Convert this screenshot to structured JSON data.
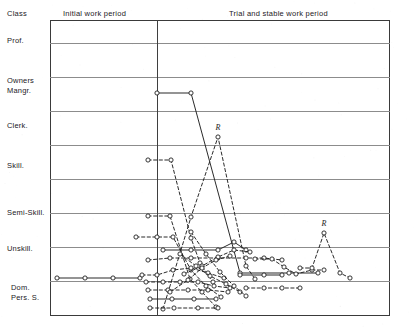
{
  "header": {
    "class_label": "Class",
    "period_initial": "Initial work period",
    "period_trial": "Trial and stable work period"
  },
  "chart_data": {
    "type": "line",
    "title": "",
    "subtitle": "",
    "xlabel": "",
    "ylabel": "Class",
    "grid": true,
    "legend_position": "none",
    "note": "Career mobility trajectories; each polyline is one subject tracked across successive jobs. Circle markers are job positions. Solid and dashed strokes distinguish individual subjects. 'R' annotates peak positions.",
    "categories": [
      "Prof.",
      "Owners Mangr.",
      "Clerk.",
      "Skill.",
      "Semi-Skill.",
      "Unskill.",
      "Dom. Pers. S."
    ],
    "y_axis_labels": [
      {
        "line1": "Prof.",
        "line2": ""
      },
      {
        "line1": "Owners",
        "line2": "Mangr."
      },
      {
        "line1": "Clerk.",
        "line2": ""
      },
      {
        "line1": "Skill.",
        "line2": ""
      },
      {
        "line1": "Semi-Skill.",
        "line2": ""
      },
      {
        "line1": "Unskill.",
        "line2": ""
      },
      {
        "line1": "Dom.",
        "line2": "Pers. S."
      }
    ],
    "y_label_positions": [
      41,
      81,
      126,
      166,
      213,
      249,
      288
    ],
    "gridline_positions": [
      23,
      57,
      91,
      125,
      159,
      193,
      227,
      261
    ],
    "divider_x": 107,
    "xlim": [
      0,
      340
    ],
    "ylim": [
      0,
      296
    ],
    "annotations": [
      {
        "text": "R",
        "x": 168,
        "y": 110,
        "series": "s-clerk-peak"
      },
      {
        "text": "R",
        "x": 274,
        "y": 206,
        "series": "s-right-peak"
      }
    ],
    "series": [
      {
        "name": "owners-descent",
        "style": "solid",
        "points": [
          [
            107,
            73
          ],
          [
            141,
            73
          ],
          [
            190,
            253
          ],
          [
            239,
            253
          ],
          [
            268,
            253
          ]
        ]
      },
      {
        "name": "clerk-peak",
        "style": "dashed",
        "points": [
          [
            113,
            289
          ],
          [
            141,
            197
          ],
          [
            168,
            117
          ],
          [
            196,
            246
          ],
          [
            205,
            259
          ]
        ]
      },
      {
        "name": "skill-start",
        "style": "dashed",
        "points": [
          [
            98,
            140
          ],
          [
            121,
            140
          ],
          [
            141,
            218
          ],
          [
            150,
            243
          ],
          [
            163,
            262
          ]
        ]
      },
      {
        "name": "semiskill-start",
        "style": "dashed",
        "points": [
          [
            98,
            196
          ],
          [
            120,
            196
          ],
          [
            140,
            259
          ],
          [
            152,
            272
          ],
          [
            166,
            287
          ]
        ]
      },
      {
        "name": "unskill-a",
        "style": "dashed",
        "points": [
          [
            86,
            217
          ],
          [
            107,
            217
          ],
          [
            123,
            217
          ],
          [
            141,
            250
          ],
          [
            156,
            266
          ],
          [
            171,
            277
          ]
        ]
      },
      {
        "name": "unskill-solid",
        "style": "solid",
        "points": [
          [
            113,
            230
          ],
          [
            141,
            230
          ],
          [
            168,
            230
          ],
          [
            184,
            222
          ],
          [
            196,
            230
          ]
        ]
      },
      {
        "name": "unskill-b",
        "style": "dashed",
        "points": [
          [
            98,
            240
          ],
          [
            120,
            238
          ],
          [
            141,
            238
          ],
          [
            168,
            238
          ],
          [
            196,
            238
          ],
          [
            214,
            238
          ],
          [
            232,
            240
          ]
        ]
      },
      {
        "name": "domestic-initial",
        "style": "solid",
        "points": [
          [
            7,
            258
          ],
          [
            35,
            258
          ],
          [
            63,
            258
          ],
          [
            90,
            258
          ]
        ]
      },
      {
        "name": "domestic-a",
        "style": "dashed",
        "points": [
          [
            92,
            255
          ],
          [
            107,
            255
          ],
          [
            123,
            250
          ],
          [
            141,
            248
          ],
          [
            158,
            253
          ],
          [
            174,
            258
          ]
        ]
      },
      {
        "name": "domestic-b",
        "style": "dashed",
        "points": [
          [
            96,
            262
          ],
          [
            113,
            262
          ],
          [
            130,
            262
          ],
          [
            148,
            262
          ],
          [
            164,
            266
          ],
          [
            180,
            268
          ]
        ]
      },
      {
        "name": "domestic-c",
        "style": "dashed",
        "points": [
          [
            98,
            270
          ],
          [
            118,
            270
          ],
          [
            138,
            270
          ],
          [
            158,
            270
          ],
          [
            178,
            272
          ]
        ]
      },
      {
        "name": "domestic-d",
        "style": "solid",
        "points": [
          [
            100,
            279
          ],
          [
            122,
            279
          ],
          [
            144,
            279
          ],
          [
            166,
            279
          ]
        ]
      },
      {
        "name": "domestic-e",
        "style": "dashed",
        "points": [
          [
            100,
            288
          ],
          [
            124,
            288
          ],
          [
            148,
            288
          ],
          [
            168,
            288
          ]
        ]
      },
      {
        "name": "mid-rise",
        "style": "dashed",
        "points": [
          [
            134,
            254
          ],
          [
            152,
            246
          ],
          [
            168,
            237
          ],
          [
            184,
            230
          ],
          [
            200,
            232
          ]
        ]
      },
      {
        "name": "mid-fall",
        "style": "dashed",
        "points": [
          [
            130,
            234
          ],
          [
            146,
            246
          ],
          [
            160,
            256
          ],
          [
            176,
            264
          ],
          [
            190,
            272
          ]
        ]
      },
      {
        "name": "right-plateau",
        "style": "dashed",
        "points": [
          [
            205,
            239
          ],
          [
            222,
            239
          ],
          [
            234,
            247
          ],
          [
            246,
            254
          ],
          [
            262,
            250
          ],
          [
            274,
            250
          ]
        ]
      },
      {
        "name": "right-peak",
        "style": "dashed",
        "points": [
          [
            250,
            248
          ],
          [
            262,
            248
          ],
          [
            274,
            213
          ],
          [
            290,
            253
          ],
          [
            300,
            258
          ]
        ]
      },
      {
        "name": "right-low",
        "style": "dashed",
        "points": [
          [
            196,
            268
          ],
          [
            214,
            268
          ],
          [
            232,
            268
          ],
          [
            250,
            268
          ]
        ]
      },
      {
        "name": "right-step",
        "style": "solid",
        "points": [
          [
            190,
            255
          ],
          [
            214,
            255
          ],
          [
            232,
            255
          ]
        ]
      },
      {
        "name": "cross-down",
        "style": "dashed",
        "points": [
          [
            141,
            212
          ],
          [
            156,
            234
          ],
          [
            170,
            252
          ],
          [
            184,
            266
          ],
          [
            196,
            276
          ]
        ]
      },
      {
        "name": "cross-up",
        "style": "dashed",
        "points": [
          [
            120,
            272
          ],
          [
            138,
            260
          ],
          [
            152,
            248
          ],
          [
            166,
            240
          ],
          [
            180,
            236
          ]
        ]
      }
    ]
  }
}
